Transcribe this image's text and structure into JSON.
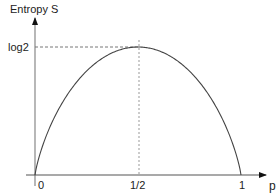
{
  "chart_data": {
    "type": "line",
    "title": "",
    "xlabel": "p",
    "ylabel": "Entropy S",
    "x_ticks": [
      "0",
      "1/2",
      "1"
    ],
    "y_ticks": [
      "log2"
    ],
    "xlim": [
      0,
      1
    ],
    "ylim": [
      0,
      0.693
    ],
    "grid": false,
    "legend": null,
    "series": [
      {
        "name": "S(p) = -p log p - (1-p) log(1-p)",
        "x": [
          0,
          0.05,
          0.1,
          0.2,
          0.3,
          0.4,
          0.5,
          0.6,
          0.7,
          0.8,
          0.9,
          0.95,
          1
        ],
        "y": [
          0,
          0.199,
          0.325,
          0.5,
          0.611,
          0.673,
          0.693,
          0.673,
          0.611,
          0.5,
          0.325,
          0.199,
          0
        ]
      }
    ],
    "annotations": [
      {
        "type": "dashed-horizontal",
        "y": "log2",
        "from_x": 0,
        "to_x": 0.5
      },
      {
        "type": "dashed-vertical",
        "x": "1/2",
        "from_y": 0,
        "to_y": "log2"
      }
    ]
  },
  "labels": {
    "y_axis": "Entropy S",
    "x_axis": "p",
    "y_tick_max": "log2",
    "x_tick_0": "0",
    "x_tick_half": "1/2",
    "x_tick_1": "1"
  }
}
